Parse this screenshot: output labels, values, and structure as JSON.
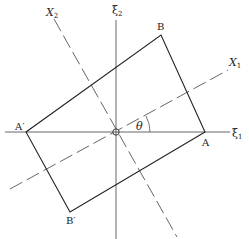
{
  "diagram": {
    "type": "coordinate-rotation",
    "colors": {
      "line": "#333333",
      "dashed": "#555555",
      "background": "#ffffff"
    },
    "origin": {
      "x": 116,
      "y": 132
    },
    "axes": {
      "xi1": {
        "label": "ξ",
        "sub": "1"
      },
      "xi2": {
        "label": "ξ",
        "sub": "2"
      },
      "X1": {
        "label": "X",
        "sub": "1"
      },
      "X2": {
        "label": "X",
        "sub": "2"
      }
    },
    "angle_label": "θ",
    "points": {
      "A": {
        "label": "A"
      },
      "B": {
        "label": "B"
      },
      "A_prime": {
        "label": "A′"
      },
      "B_prime": {
        "label": "B′"
      }
    }
  }
}
